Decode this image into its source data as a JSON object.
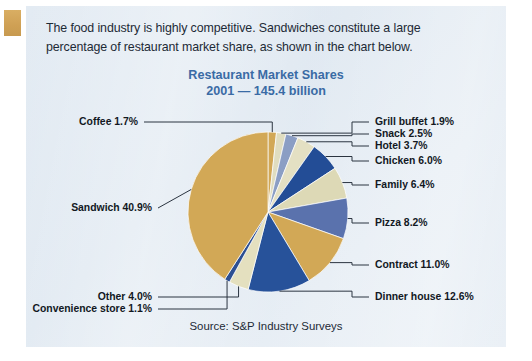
{
  "document": {
    "intro_text": "The food industry is highly competitive. Sandwiches constitute a large percentage of restaurant market share, as shown in the chart below.",
    "tab_color": "#cfa054",
    "panel_color": "#e3ebf3"
  },
  "chart_data": {
    "type": "pie",
    "title": "Restaurant Market Shares",
    "subtitle": "2001 — 145.4 billion",
    "source": "Source: S&P Industry Surveys",
    "title_color": "#3a6ba5",
    "unit": "%",
    "total_billion": 145.4,
    "year": "2001",
    "legend_position": "callout-labels",
    "categories": [
      "Coffee",
      "Grill buffet",
      "Snack",
      "Hotel",
      "Chicken",
      "Family",
      "Pizza",
      "Contract",
      "Dinner house",
      "Other",
      "Convenience store",
      "Sandwich"
    ],
    "values": [
      1.7,
      1.9,
      2.5,
      3.7,
      6.0,
      6.4,
      8.2,
      11.0,
      12.6,
      4.0,
      1.1,
      40.9
    ],
    "colors": [
      "#d2a856",
      "#8b9ec4",
      "#e8e4c6",
      "#27529a",
      "#ddd9b6",
      "#5a72ad",
      "#c9a košice",
      "#27529a",
      "#27529a",
      "#e4e0bf",
      "#2c4f92",
      "#d2a856"
    ],
    "slices": [
      {
        "label": "Coffee",
        "value": 1.7,
        "display": "Coffee 1.7%",
        "color": "#d2a856",
        "side": "left"
      },
      {
        "label": "Grill buffet",
        "value": 1.9,
        "display": "Grill buffet 1.9%",
        "color": "#e0ddc0",
        "side": "right"
      },
      {
        "label": "Snack",
        "value": 2.5,
        "display": "Snack 2.5%",
        "color": "#8b9ec4",
        "side": "right"
      },
      {
        "label": "Hotel",
        "value": 3.7,
        "display": "Hotel 3.7%",
        "color": "#e4e0c3",
        "side": "right"
      },
      {
        "label": "Chicken",
        "value": 6.0,
        "display": "Chicken 6.0%",
        "color": "#234d96",
        "side": "right"
      },
      {
        "label": "Family",
        "value": 6.4,
        "display": "Family 6.4%",
        "color": "#ddd9b6",
        "side": "right"
      },
      {
        "label": "Pizza",
        "value": 8.2,
        "display": "Pizza 8.2%",
        "color": "#5a72ad",
        "side": "right"
      },
      {
        "label": "Contract",
        "value": 11.0,
        "display": "Contract 11.0%",
        "color": "#d2a856",
        "side": "right"
      },
      {
        "label": "Dinner house",
        "value": 12.6,
        "display": "Dinner house 12.6%",
        "color": "#27529a",
        "side": "right"
      },
      {
        "label": "Other",
        "value": 4.0,
        "display": "Other 4.0%",
        "color": "#e4e0bf",
        "side": "left"
      },
      {
        "label": "Convenience store",
        "value": 1.1,
        "display": "Convenience store 1.1%",
        "color": "#2c4f92",
        "side": "left"
      },
      {
        "label": "Sandwich",
        "value": 40.9,
        "display": "Sandwich 40.9%",
        "color": "#d2a856",
        "side": "left"
      }
    ],
    "layout": {
      "cx": 268,
      "cy": 212,
      "r": 80,
      "start_angle_deg": -90,
      "label_rows_right": [
        {
          "label": "Grill buffet 1.9%",
          "x": 375,
          "y": 122,
          "elbow_x": 352
        },
        {
          "label": "Snack 2.5%",
          "x": 375,
          "y": 134,
          "elbow_x": 352
        },
        {
          "label": "Hotel 3.7%",
          "x": 375,
          "y": 146,
          "elbow_x": 352
        },
        {
          "label": "Chicken 6.0%",
          "x": 375,
          "y": 161,
          "elbow_x": 352
        },
        {
          "label": "Family 6.4%",
          "x": 375,
          "y": 185,
          "elbow_x": 352
        },
        {
          "label": "Pizza 8.2%",
          "x": 375,
          "y": 223,
          "elbow_x": 352
        },
        {
          "label": "Contract 11.0%",
          "x": 375,
          "y": 265,
          "elbow_x": 352
        },
        {
          "label": "Dinner house 12.6%",
          "x": 375,
          "y": 297,
          "elbow_x": 352
        }
      ],
      "label_rows_left": [
        {
          "label": "Coffee 1.7%",
          "x": 138,
          "y": 122
        },
        {
          "label": "Sandwich 40.9%",
          "x": 152,
          "y": 208
        },
        {
          "label": "Other 4.0%",
          "x": 152,
          "y": 297
        },
        {
          "label": "Convenience store 1.1%",
          "x": 152,
          "y": 309
        }
      ]
    }
  }
}
